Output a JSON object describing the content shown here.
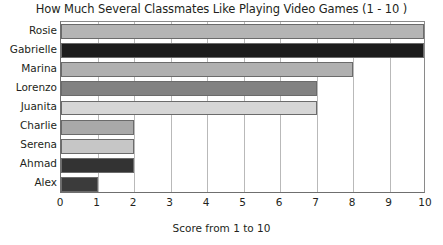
{
  "chart_data": {
    "type": "bar",
    "orientation": "horizontal",
    "title": "How Much Several Classmates Like Playing Video Games (1 - 10 )",
    "xlabel": "Score from 1 to 10",
    "ylabel": "",
    "xlim": [
      0,
      10
    ],
    "grid": true,
    "legend": null,
    "categories": [
      "Rosie",
      "Gabrielle",
      "Marina",
      "Lorenzo",
      "Juanita",
      "Charlie",
      "Serena",
      "Ahmad",
      "Alex"
    ],
    "values": [
      10,
      10,
      8,
      7,
      7,
      2,
      2,
      2,
      1
    ],
    "bar_colors": [
      "#b4b4b4",
      "#1c1c1c",
      "#b0b0b0",
      "#828282",
      "#d6d6d6",
      "#a9a9a9",
      "#c6c6c6",
      "#333333",
      "#3b3b3b"
    ],
    "xticks": [
      "0",
      "1",
      "2",
      "3",
      "4",
      "5",
      "6",
      "7",
      "8",
      "9",
      "10"
    ],
    "xtick_values": [
      0,
      1,
      2,
      3,
      4,
      5,
      6,
      7,
      8,
      9,
      10
    ]
  },
  "style": {
    "axis_color": "#6f6f6f",
    "grid_color": "#b9b9b9",
    "text_color": "#231f20",
    "background": "#ffffff"
  }
}
